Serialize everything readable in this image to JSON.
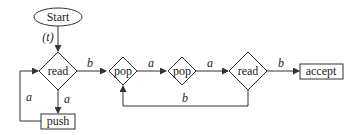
{
  "diagram": {
    "type": "flowchart",
    "nodes": {
      "start": {
        "label": "Start",
        "shape": "ellipse"
      },
      "read1": {
        "label": "read",
        "shape": "diamond"
      },
      "push": {
        "label": "push",
        "shape": "rect"
      },
      "pop1": {
        "label": "pop",
        "shape": "diamond"
      },
      "pop2": {
        "label": "pop",
        "shape": "diamond"
      },
      "read2": {
        "label": "read",
        "shape": "diamond"
      },
      "accept": {
        "label": "accept",
        "shape": "rect"
      }
    },
    "edges": {
      "start_read1": {
        "from": "start",
        "to": "read1",
        "label": "(t)"
      },
      "read1_push": {
        "from": "read1",
        "to": "push",
        "label": "a"
      },
      "push_read1": {
        "from": "push",
        "to": "read1",
        "label": "a"
      },
      "read1_pop1": {
        "from": "read1",
        "to": "pop1",
        "label": "b"
      },
      "pop1_pop2": {
        "from": "pop1",
        "to": "pop2",
        "label": "a"
      },
      "pop2_read2": {
        "from": "pop2",
        "to": "read2",
        "label": "a"
      },
      "read2_accept": {
        "from": "read2",
        "to": "accept",
        "label": "b"
      },
      "read2_pop1": {
        "from": "read2",
        "to": "pop1",
        "label": "b"
      }
    },
    "colors": {
      "stroke": "#333333",
      "text": "#222222",
      "background": "#ffffff"
    }
  }
}
